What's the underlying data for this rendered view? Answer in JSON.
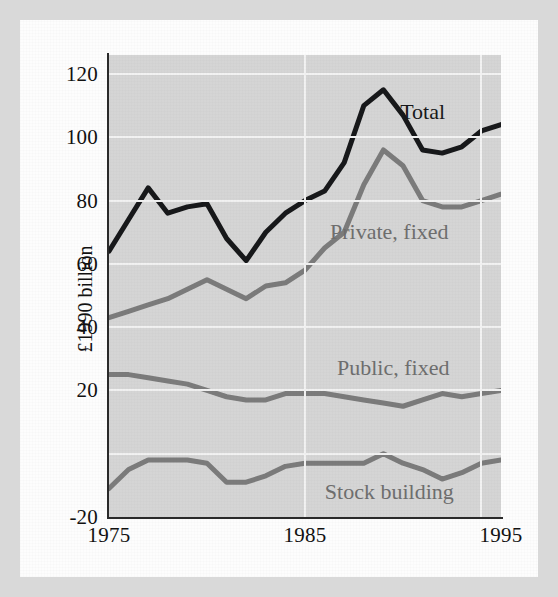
{
  "figure": {
    "background_color": "#d5d5d5",
    "page_color": "#fdfdfd",
    "frame_color": "#d9d9d9"
  },
  "chart_data": {
    "type": "line",
    "title": "",
    "xlabel": "",
    "ylabel": "£1990 billion",
    "xlim": [
      1975,
      1995
    ],
    "ylim": [
      -20,
      126
    ],
    "yticks": [
      -20,
      20,
      40,
      60,
      80,
      100,
      120
    ],
    "ytick_labels": [
      "-20",
      "20",
      "40",
      "60",
      "80",
      "100",
      "120"
    ],
    "gridlines_y": [
      0,
      20,
      40,
      60,
      80,
      100,
      120
    ],
    "xticks": [
      1975,
      1985,
      1995
    ],
    "xtick_labels": [
      "1975",
      "1985",
      "1995"
    ],
    "gridlines_x": [
      1985,
      1994
    ],
    "grid": true,
    "legend_position": "inline-annotations",
    "x": [
      1975,
      1976,
      1977,
      1978,
      1979,
      1980,
      1981,
      1982,
      1983,
      1984,
      1985,
      1986,
      1987,
      1988,
      1989,
      1990,
      1991,
      1992,
      1993,
      1994,
      1995
    ],
    "series": [
      {
        "name": "Total",
        "color": "#17181a",
        "width": 5,
        "label_x": 1991.0,
        "label_y": 108,
        "values": [
          64,
          74,
          84,
          76,
          78,
          79,
          68,
          61,
          70,
          76,
          80,
          83,
          92,
          110,
          115,
          107,
          96,
          95,
          97,
          102,
          104
        ]
      },
      {
        "name": "Private, fixed",
        "color": "#7b7b7b",
        "width": 5,
        "label_x": 1989.3,
        "label_y": 70,
        "values": [
          43,
          45,
          47,
          49,
          52,
          55,
          52,
          49,
          53,
          54,
          58,
          65,
          70,
          85,
          96,
          91,
          80,
          78,
          78,
          80,
          82
        ]
      },
      {
        "name": "Public, fixed",
        "color": "#7b7b7b",
        "width": 5,
        "label_x": 1989.5,
        "label_y": 27,
        "values": [
          25,
          25,
          24,
          23,
          22,
          20,
          18,
          17,
          17,
          19,
          19,
          19,
          18,
          17,
          16,
          15,
          17,
          19,
          18,
          19,
          20
        ]
      },
      {
        "name": "Stock building",
        "color": "#7b7b7b",
        "width": 5,
        "label_x": 1989.3,
        "label_y": -12,
        "values": [
          -11,
          -5,
          -2,
          -2,
          -2,
          -3,
          -9,
          -9,
          -7,
          -4,
          -3,
          -3,
          -3,
          -3,
          0,
          -3,
          -5,
          -8,
          -6,
          -3,
          -2
        ]
      }
    ]
  },
  "axis": {
    "y_title": "£1990 billion"
  }
}
